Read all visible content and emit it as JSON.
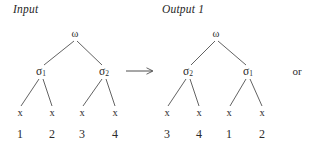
{
  "figure": {
    "input_caption": "Input",
    "output_caption": "Output 1",
    "or_label": "or",
    "arrow_glyph": "⟶",
    "trees": [
      {
        "id": "input-tree",
        "root": {
          "label": "ω",
          "x": 75,
          "y": 34
        },
        "internal": [
          {
            "label": "σ",
            "sub": "1",
            "x": 41,
            "y": 72
          },
          {
            "label": "σ",
            "sub": "2",
            "x": 104,
            "y": 72
          }
        ],
        "leaves": [
          {
            "symbol": "x",
            "index": "1",
            "x": 20,
            "y": 113,
            "num_y": 134
          },
          {
            "symbol": "x",
            "index": "2",
            "x": 52,
            "y": 113,
            "num_y": 134
          },
          {
            "symbol": "x",
            "index": "3",
            "x": 82,
            "y": 113,
            "num_y": 134
          },
          {
            "symbol": "x",
            "index": "4",
            "x": 115,
            "y": 113,
            "num_y": 134
          }
        ]
      },
      {
        "id": "output-tree",
        "root": {
          "label": "ω",
          "x": 216,
          "y": 34
        },
        "internal": [
          {
            "label": "σ",
            "sub": "2",
            "x": 188,
            "y": 72
          },
          {
            "label": "σ",
            "sub": "1",
            "x": 248,
            "y": 72
          }
        ],
        "leaves": [
          {
            "symbol": "x",
            "index": "3",
            "x": 167,
            "y": 113,
            "num_y": 134
          },
          {
            "symbol": "x",
            "index": "4",
            "x": 199,
            "y": 113,
            "num_y": 134
          },
          {
            "symbol": "x",
            "index": "1",
            "x": 229,
            "y": 113,
            "num_y": 134
          },
          {
            "symbol": "x",
            "index": "2",
            "x": 262,
            "y": 113,
            "num_y": 134
          }
        ]
      }
    ],
    "arrow": {
      "x1": 126,
      "x2": 153,
      "y": 71
    },
    "or_position": {
      "x": 297,
      "y": 71
    },
    "colors": {
      "background": "#ffffff",
      "text": "#2b2b2b",
      "edge": "#3a3a3a"
    }
  }
}
